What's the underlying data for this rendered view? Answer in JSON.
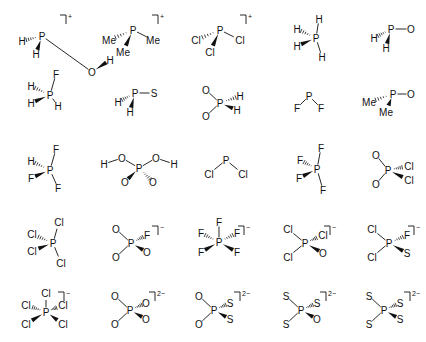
{
  "figure": {
    "rows": 5,
    "cols": 5
  },
  "molecules": [
    {
      "id": "m1",
      "cx": 42,
      "cy": 36,
      "center": "P",
      "charge": "+",
      "bracket": [
        66,
        15
      ],
      "atoms": [
        {
          "label": "O",
          "x": 50,
          "y": 36,
          "bond": "plain"
        },
        {
          "label": "H",
          "x": 68,
          "y": 24,
          "bond": "wedge",
          "from": "O"
        },
        {
          "label": "H",
          "x": -20,
          "y": 5,
          "bond": "hash"
        },
        {
          "label": "H",
          "x": -6,
          "y": 18,
          "bond": "wedge"
        }
      ]
    },
    {
      "id": "m2",
      "cx": 133,
      "cy": 30,
      "center": "P",
      "charge": "+",
      "bracket": [
        158,
        15
      ],
      "atoms": [
        {
          "label": "Me",
          "x": -24,
          "y": 10,
          "bond": "hash"
        },
        {
          "label": "Me",
          "x": 20,
          "y": 10,
          "bond": "plain"
        },
        {
          "label": "Me",
          "x": -10,
          "y": 22,
          "bond": "wedge"
        }
      ]
    },
    {
      "id": "m3",
      "cx": 220,
      "cy": 30,
      "center": "P",
      "charge": "+",
      "bracket": [
        246,
        15
      ],
      "atoms": [
        {
          "label": "Cl",
          "x": -24,
          "y": 10,
          "bond": "hash"
        },
        {
          "label": "Cl",
          "x": 20,
          "y": 10,
          "bond": "plain"
        },
        {
          "label": "Cl",
          "x": -10,
          "y": 22,
          "bond": "wedge"
        }
      ]
    },
    {
      "id": "m4",
      "cx": 316,
      "cy": 38,
      "center": "P",
      "charge": "",
      "bracket": null,
      "atoms": [
        {
          "label": "H",
          "x": 3,
          "y": -19,
          "bond": "plain"
        },
        {
          "label": "H",
          "x": -19,
          "y": -9,
          "bond": "hash"
        },
        {
          "label": "H",
          "x": -19,
          "y": 8,
          "bond": "wedge"
        },
        {
          "label": "H",
          "x": 6,
          "y": 19,
          "bond": "plain"
        }
      ]
    },
    {
      "id": "m5",
      "cx": 391,
      "cy": 29,
      "center": "P",
      "charge": "",
      "bracket": null,
      "atoms": [
        {
          "label": "O",
          "x": 20,
          "y": 0,
          "bond": "plain"
        },
        {
          "label": "H",
          "x": -17,
          "y": 9,
          "bond": "hash"
        },
        {
          "label": "H",
          "x": -5,
          "y": 19,
          "bond": "wedge"
        }
      ]
    },
    {
      "id": "m6",
      "cx": 50,
      "cy": 95,
      "center": "P",
      "charge": "",
      "bracket": null,
      "atoms": [
        {
          "label": "F",
          "x": 6,
          "y": -21,
          "bond": "plain"
        },
        {
          "label": "H",
          "x": -19,
          "y": -9,
          "bond": "hash"
        },
        {
          "label": "H",
          "x": -19,
          "y": 8,
          "bond": "wedge"
        },
        {
          "label": "H",
          "x": 8,
          "y": 11,
          "bond": "plain"
        }
      ]
    },
    {
      "id": "m7",
      "cx": 135,
      "cy": 93,
      "center": "P",
      "charge": "",
      "bracket": null,
      "atoms": [
        {
          "label": "S",
          "x": 19,
          "y": 0,
          "bond": "plain"
        },
        {
          "label": "H",
          "x": -17,
          "y": 9,
          "bond": "hash"
        },
        {
          "label": "H",
          "x": -5,
          "y": 19,
          "bond": "wedge"
        }
      ]
    },
    {
      "id": "m8",
      "cx": 220,
      "cy": 103,
      "center": "P",
      "charge": "",
      "bracket": null,
      "atoms": [
        {
          "label": "O",
          "x": -14,
          "y": -13,
          "bond": "plain"
        },
        {
          "label": "O",
          "x": -14,
          "y": 13,
          "bond": "plain"
        },
        {
          "label": "H",
          "x": 20,
          "y": -7,
          "bond": "hash"
        },
        {
          "label": "H",
          "x": 17,
          "y": 7,
          "bond": "wedge"
        }
      ]
    },
    {
      "id": "m9",
      "cx": 309,
      "cy": 96,
      "center": "P",
      "charge": "",
      "bracket": null,
      "atoms": [
        {
          "label": "F",
          "x": -12,
          "y": 12,
          "bond": "plain"
        },
        {
          "label": "F",
          "x": 12,
          "y": 12,
          "bond": "plain"
        }
      ]
    },
    {
      "id": "m10",
      "cx": 393,
      "cy": 94,
      "center": "P",
      "charge": "",
      "bracket": null,
      "atoms": [
        {
          "label": "O",
          "x": 18,
          "y": 0,
          "bond": "plain"
        },
        {
          "label": "Me",
          "x": -24,
          "y": 8,
          "bond": "hash"
        },
        {
          "label": "Me",
          "x": -7,
          "y": 18,
          "bond": "wedge"
        }
      ]
    },
    {
      "id": "m11",
      "cx": 50,
      "cy": 170,
      "center": "P",
      "charge": "",
      "bracket": null,
      "atoms": [
        {
          "label": "F",
          "x": 6,
          "y": -21,
          "bond": "plain"
        },
        {
          "label": "H",
          "x": -19,
          "y": -9,
          "bond": "hash"
        },
        {
          "label": "F",
          "x": -19,
          "y": 8,
          "bond": "wedge"
        },
        {
          "label": "F",
          "x": 8,
          "y": 18,
          "bond": "plain"
        }
      ]
    },
    {
      "id": "m12",
      "cx": 139,
      "cy": 168,
      "center": "P",
      "charge": "",
      "bracket": null,
      "atoms": [
        {
          "label": "O",
          "x": -17,
          "y": -10,
          "bond": "plain"
        },
        {
          "label": "H",
          "x": -35,
          "y": -4,
          "bond": "plain",
          "from": "O0"
        },
        {
          "label": "O",
          "x": 17,
          "y": -10,
          "bond": "plain"
        },
        {
          "label": "H",
          "x": 35,
          "y": -4,
          "bond": "plain",
          "from": "O2"
        },
        {
          "label": "O",
          "x": -14,
          "y": 14,
          "bond": "wedge"
        },
        {
          "label": "O",
          "x": 14,
          "y": 14,
          "bond": "hash"
        }
      ]
    },
    {
      "id": "m13",
      "cx": 226,
      "cy": 160,
      "center": "P",
      "charge": "",
      "bracket": null,
      "atoms": [
        {
          "label": "Cl",
          "x": -17,
          "y": 14,
          "bond": "plain"
        },
        {
          "label": "Cl",
          "x": 17,
          "y": 14,
          "bond": "plain"
        }
      ]
    },
    {
      "id": "m14",
      "cx": 317,
      "cy": 169,
      "center": "P",
      "charge": "",
      "bracket": null,
      "atoms": [
        {
          "label": "F",
          "x": 4,
          "y": -21,
          "bond": "plain"
        },
        {
          "label": "F",
          "x": -17,
          "y": -9,
          "bond": "hash"
        },
        {
          "label": "F",
          "x": -18,
          "y": 9,
          "bond": "wedge"
        },
        {
          "label": "F",
          "x": 6,
          "y": 21,
          "bond": "plain"
        }
      ]
    },
    {
      "id": "m15",
      "cx": 388,
      "cy": 170,
      "center": "P",
      "charge": "",
      "bracket": null,
      "atoms": [
        {
          "label": "O",
          "x": -12,
          "y": -15,
          "bond": "plain"
        },
        {
          "label": "O",
          "x": -12,
          "y": 14,
          "bond": "plain"
        },
        {
          "label": "Cl",
          "x": 21,
          "y": -4,
          "bond": "hash"
        },
        {
          "label": "Cl",
          "x": 21,
          "y": 10,
          "bond": "wedge"
        }
      ]
    },
    {
      "id": "m16",
      "cx": 53,
      "cy": 243,
      "center": "P",
      "charge": "",
      "bracket": null,
      "atoms": [
        {
          "label": "Cl",
          "x": 6,
          "y": -21,
          "bond": "plain"
        },
        {
          "label": "Cl",
          "x": -21,
          "y": -9,
          "bond": "hash"
        },
        {
          "label": "Cl",
          "x": -21,
          "y": 8,
          "bond": "wedge"
        },
        {
          "label": "Cl",
          "x": 8,
          "y": 20,
          "bond": "plain"
        }
      ]
    },
    {
      "id": "m17",
      "cx": 131,
      "cy": 243,
      "center": "P",
      "charge": "−",
      "bracket": [
        158,
        226
      ],
      "atoms": [
        {
          "label": "O",
          "x": -15,
          "y": -14,
          "bond": "plain"
        },
        {
          "label": "O",
          "x": -15,
          "y": 14,
          "bond": "plain"
        },
        {
          "label": "F",
          "x": 16,
          "y": -8,
          "bond": "hash"
        },
        {
          "label": "O",
          "x": 16,
          "y": 9,
          "bond": "wedge"
        }
      ]
    },
    {
      "id": "m18",
      "cx": 219,
      "cy": 242,
      "center": "P",
      "charge": "−",
      "bracket": [
        244,
        226
      ],
      "atoms": [
        {
          "label": "F",
          "x": 0,
          "y": -20,
          "bond": "plain"
        },
        {
          "label": "F",
          "x": -18,
          "y": -9,
          "bond": "hash"
        },
        {
          "label": "F",
          "x": 18,
          "y": -9,
          "bond": "hash"
        },
        {
          "label": "F",
          "x": -18,
          "y": 10,
          "bond": "wedge"
        },
        {
          "label": "F",
          "x": 18,
          "y": 10,
          "bond": "wedge"
        }
      ]
    },
    {
      "id": "m19",
      "cx": 305,
      "cy": 243,
      "center": "P",
      "charge": "−",
      "bracket": [
        330,
        226
      ],
      "atoms": [
        {
          "label": "Cl",
          "x": -17,
          "y": -14,
          "bond": "plain"
        },
        {
          "label": "Cl",
          "x": -17,
          "y": 14,
          "bond": "plain"
        },
        {
          "label": "Cl",
          "x": 18,
          "y": -8,
          "bond": "hash"
        },
        {
          "label": "O",
          "x": 18,
          "y": 10,
          "bond": "wedge"
        }
      ]
    },
    {
      "id": "m20",
      "cx": 389,
      "cy": 243,
      "center": "P",
      "charge": "−",
      "bracket": [
        414,
        226
      ],
      "atoms": [
        {
          "label": "Cl",
          "x": -17,
          "y": -14,
          "bond": "plain"
        },
        {
          "label": "Cl",
          "x": -17,
          "y": 14,
          "bond": "plain"
        },
        {
          "label": "F",
          "x": 18,
          "y": -8,
          "bond": "hash"
        },
        {
          "label": "S",
          "x": 18,
          "y": 10,
          "bond": "wedge"
        }
      ]
    },
    {
      "id": "m21",
      "cx": 46,
      "cy": 312,
      "center": "P",
      "charge": "−",
      "bracket": [
        64,
        292
      ],
      "atoms": [
        {
          "label": "Cl",
          "x": 0,
          "y": -19,
          "bond": "plain"
        },
        {
          "label": "Cl",
          "x": -20,
          "y": -7,
          "bond": "hash"
        },
        {
          "label": "Cl",
          "x": 17,
          "y": -7,
          "bond": "hash"
        },
        {
          "label": "Cl",
          "x": -20,
          "y": 12,
          "bond": "wedge"
        },
        {
          "label": "Cl",
          "x": 17,
          "y": 12,
          "bond": "wedge"
        }
      ]
    },
    {
      "id": "m22",
      "cx": 130,
      "cy": 310,
      "center": "P",
      "charge": "2−",
      "bracket": [
        155,
        292
      ],
      "atoms": [
        {
          "label": "O",
          "x": -15,
          "y": -14,
          "bond": "plain"
        },
        {
          "label": "O",
          "x": -15,
          "y": 14,
          "bond": "plain"
        },
        {
          "label": "O",
          "x": 16,
          "y": -7,
          "bond": "hash"
        },
        {
          "label": "O",
          "x": 16,
          "y": 9,
          "bond": "wedge"
        }
      ]
    },
    {
      "id": "m23",
      "cx": 214,
      "cy": 310,
      "center": "P",
      "charge": "2−",
      "bracket": [
        240,
        292
      ],
      "atoms": [
        {
          "label": "O",
          "x": -15,
          "y": -14,
          "bond": "plain"
        },
        {
          "label": "O",
          "x": -15,
          "y": 14,
          "bond": "plain"
        },
        {
          "label": "S",
          "x": 16,
          "y": -7,
          "bond": "hash"
        },
        {
          "label": "S",
          "x": 16,
          "y": 9,
          "bond": "wedge"
        }
      ]
    },
    {
      "id": "m24",
      "cx": 301,
      "cy": 310,
      "center": "P",
      "charge": "2−",
      "bracket": [
        326,
        292
      ],
      "atoms": [
        {
          "label": "S",
          "x": -15,
          "y": -14,
          "bond": "plain"
        },
        {
          "label": "S",
          "x": -15,
          "y": 14,
          "bond": "plain"
        },
        {
          "label": "S",
          "x": 16,
          "y": -7,
          "bond": "hash"
        },
        {
          "label": "O",
          "x": 16,
          "y": 9,
          "bond": "wedge"
        }
      ]
    },
    {
      "id": "m25",
      "cx": 384,
      "cy": 310,
      "center": "P",
      "charge": "2−",
      "bracket": [
        410,
        292
      ],
      "atoms": [
        {
          "label": "S",
          "x": -15,
          "y": -14,
          "bond": "plain"
        },
        {
          "label": "S",
          "x": -15,
          "y": 14,
          "bond": "plain"
        },
        {
          "label": "S",
          "x": 16,
          "y": -7,
          "bond": "hash"
        },
        {
          "label": "S",
          "x": 16,
          "y": 9,
          "bond": "wedge"
        }
      ]
    }
  ]
}
